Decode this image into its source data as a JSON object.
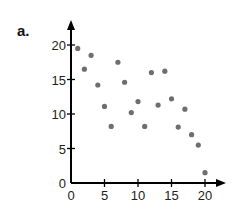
{
  "panel_label": "a.",
  "chart_data": {
    "type": "scatter",
    "title": "",
    "xlabel": "",
    "ylabel": "",
    "xlim": [
      0,
      20
    ],
    "ylim": [
      0,
      20
    ],
    "x_ticks": [
      0,
      5,
      10,
      15,
      20
    ],
    "y_ticks": [
      0,
      5,
      10,
      15,
      20
    ],
    "x_tick_labels": [
      "0",
      "5",
      "10",
      "15",
      "20"
    ],
    "y_tick_labels": [
      "0",
      "5",
      "10",
      "15",
      "20"
    ],
    "grid": false,
    "legend": null,
    "point_color": "#6e6e6e",
    "axis_color": "#000000",
    "x": [
      1,
      2,
      3,
      4,
      5,
      6,
      7,
      8,
      9,
      10,
      11,
      12,
      13,
      14,
      15,
      16,
      17,
      18,
      19,
      20
    ],
    "y": [
      19.5,
      16.5,
      18.5,
      14.2,
      11.1,
      8.2,
      17.5,
      14.6,
      10.2,
      11.8,
      8.2,
      16,
      11.3,
      16.2,
      12.2,
      8.1,
      10.7,
      7,
      5.5,
      1.5
    ]
  }
}
